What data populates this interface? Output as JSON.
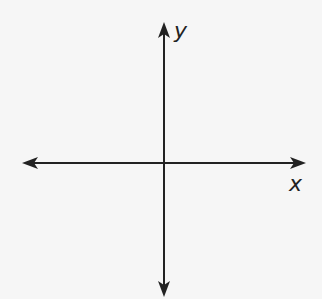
{
  "diagram": {
    "type": "coordinate-axes",
    "x_axis": {
      "label": "x",
      "y_position": 163,
      "x_start": 22,
      "x_end": 306,
      "arrows": [
        "left",
        "right"
      ]
    },
    "y_axis": {
      "label": "y",
      "x_position": 164,
      "y_start": 22,
      "y_end": 297,
      "arrows": [
        "up",
        "down"
      ]
    },
    "origin": {
      "x": 164,
      "y": 163
    },
    "colors": {
      "background": "#f6f6f6",
      "line": "#222222"
    }
  }
}
